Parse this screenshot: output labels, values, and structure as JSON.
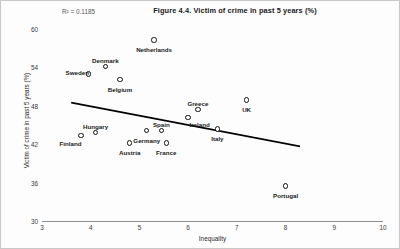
{
  "figure": {
    "title": "Figure 4.4. Victim of crime in past 5 years (%)",
    "r2_text": "R² = 0.1185",
    "r2_value": 0.1185,
    "background_color": "#fdfdfd",
    "border_color": "#c8c8c8",
    "marker_color": "#111111",
    "trendline_color": "#000000"
  },
  "axes": {
    "x_title": "Inequality",
    "y_title": "Victim of crime in past 5 years (%)",
    "x_ticks": [
      "3",
      "4",
      "5",
      "6",
      "7",
      "8",
      "9",
      "10"
    ],
    "y_ticks": [
      "60",
      "54",
      "48",
      "42",
      "36",
      "30"
    ]
  },
  "chart_data": {
    "type": "scatter",
    "title": "Figure 4.4. Victim of crime in past 5 years (%)",
    "xlabel": "Inequality",
    "ylabel": "Victim of crime in past 5 years (%)",
    "xlim": [
      3,
      10
    ],
    "ylim": [
      30,
      60
    ],
    "xticks": [
      3,
      4,
      5,
      6,
      7,
      8,
      9,
      10
    ],
    "yticks": [
      30,
      36,
      42,
      48,
      54,
      60
    ],
    "grid": false,
    "legend": false,
    "r_squared": 0.1185,
    "annotations": [
      "R² = 0.1185"
    ],
    "trendline": {
      "type": "linear",
      "x_start": 3.6,
      "y_start": 48.5,
      "x_end": 8.4,
      "y_end": 41.5
    },
    "points": [
      {
        "label": "Netherlands",
        "x": 5.3,
        "y": 58.3,
        "label_pos": "below"
      },
      {
        "label": "Denmark",
        "x": 4.3,
        "y": 54.1,
        "label_pos": "above"
      },
      {
        "label": "Sweden",
        "x": 3.96,
        "y": 53.0,
        "label_pos": "above-left"
      },
      {
        "label": "Belgium",
        "x": 4.6,
        "y": 52.1,
        "label_pos": "below"
      },
      {
        "label": "UK",
        "x": 7.2,
        "y": 48.9,
        "label_pos": "below"
      },
      {
        "label": "Greece",
        "x": 6.2,
        "y": 47.4,
        "label_pos": "above"
      },
      {
        "label": "Ireland",
        "x": 6.0,
        "y": 46.2,
        "label_pos": "below-right"
      },
      {
        "label": "Italy",
        "x": 6.6,
        "y": 44.4,
        "label_pos": "below"
      },
      {
        "label": "Spain",
        "x": 5.45,
        "y": 44.1,
        "label_pos": "above"
      },
      {
        "label": "Germany",
        "x": 5.15,
        "y": 44.1,
        "label_pos": "below"
      },
      {
        "label": "Hungary",
        "x": 4.1,
        "y": 43.8,
        "label_pos": "above"
      },
      {
        "label": "Finland",
        "x": 3.8,
        "y": 43.4,
        "label_pos": "below-left"
      },
      {
        "label": "Austria",
        "x": 4.8,
        "y": 42.2,
        "label_pos": "below"
      },
      {
        "label": "France",
        "x": 5.55,
        "y": 42.2,
        "label_pos": "below"
      },
      {
        "label": "Portugal",
        "x": 8.0,
        "y": 35.5,
        "label_pos": "below"
      }
    ]
  }
}
